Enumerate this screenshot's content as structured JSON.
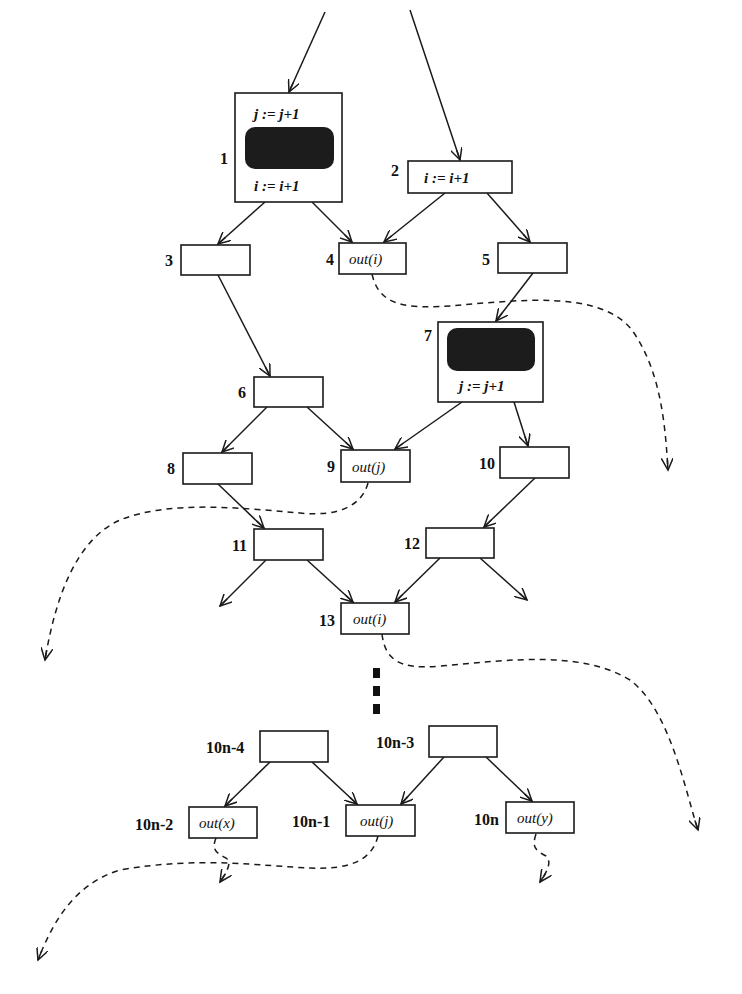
{
  "diagram": {
    "type": "control-flow-graph",
    "nodes": [
      {
        "id": "1",
        "label": "1",
        "lines": [
          "j := j+1",
          "i := i+1"
        ],
        "has_blob": true
      },
      {
        "id": "2",
        "label": "2",
        "text": "i := i+1"
      },
      {
        "id": "3",
        "label": "3",
        "text": ""
      },
      {
        "id": "4",
        "label": "4",
        "text": "out(i)"
      },
      {
        "id": "5",
        "label": "5",
        "text": ""
      },
      {
        "id": "6",
        "label": "6",
        "text": ""
      },
      {
        "id": "7",
        "label": "7",
        "lines": [
          "j := j+1"
        ],
        "has_blob": true
      },
      {
        "id": "8",
        "label": "8",
        "text": ""
      },
      {
        "id": "9",
        "label": "9",
        "text": "out(j)"
      },
      {
        "id": "10",
        "label": "10",
        "text": ""
      },
      {
        "id": "11",
        "label": "11",
        "text": ""
      },
      {
        "id": "12",
        "label": "12",
        "text": ""
      },
      {
        "id": "13",
        "label": "13",
        "text": "out(i)"
      },
      {
        "id": "10n-4",
        "label": "10n-4",
        "text": ""
      },
      {
        "id": "10n-3",
        "label": "10n-3",
        "text": ""
      },
      {
        "id": "10n-2",
        "label": "10n-2",
        "text": "out(x)"
      },
      {
        "id": "10n-1",
        "label": "10n-1",
        "text": "out(j)"
      },
      {
        "id": "10n",
        "label": "10n",
        "text": "out(y)"
      }
    ],
    "edges": [
      [
        "entry-left",
        "1"
      ],
      [
        "entry-right",
        "2"
      ],
      [
        "1",
        "3"
      ],
      [
        "1",
        "4"
      ],
      [
        "2",
        "4"
      ],
      [
        "2",
        "5"
      ],
      [
        "3",
        "6"
      ],
      [
        "5",
        "7"
      ],
      [
        "6",
        "8"
      ],
      [
        "6",
        "9"
      ],
      [
        "7",
        "9"
      ],
      [
        "7",
        "10"
      ],
      [
        "8",
        "11"
      ],
      [
        "10",
        "12"
      ],
      [
        "11",
        "exit-left"
      ],
      [
        "11",
        "13"
      ],
      [
        "12",
        "13"
      ],
      [
        "12",
        "exit-right"
      ],
      [
        "10n-4",
        "10n-2"
      ],
      [
        "10n-4",
        "10n-1"
      ],
      [
        "10n-3",
        "10n-1"
      ],
      [
        "10n-3",
        "10n"
      ]
    ],
    "dashed_edges": [
      [
        "4",
        "far-right"
      ],
      [
        "9",
        "far-left"
      ],
      [
        "13",
        "far-right"
      ],
      [
        "10n-1",
        "far-left"
      ],
      [
        "10n-2",
        "down"
      ],
      [
        "10n",
        "down"
      ]
    ],
    "ellipsis": "vertical-dots"
  }
}
